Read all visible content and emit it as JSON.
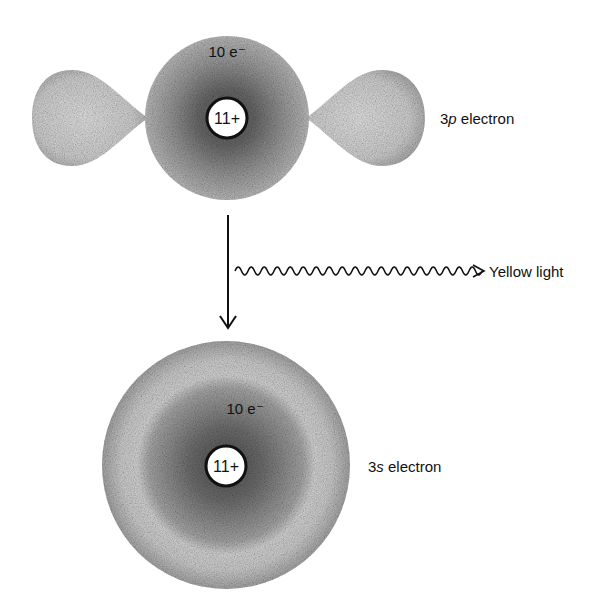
{
  "top_atom": {
    "core_label": "10 e⁻",
    "nucleus_label": "11+",
    "orbital_label_prefix": "3",
    "orbital_label_letter": "p",
    "orbital_label_suffix": " electron"
  },
  "transition": {
    "emission_label": "Yellow light"
  },
  "bottom_atom": {
    "core_label": "10 e⁻",
    "nucleus_label": "11+",
    "orbital_label_prefix": "3",
    "orbital_label_letter": "s",
    "orbital_label_suffix": " electron"
  },
  "colors": {
    "background": "#ffffff",
    "ink": "#111111",
    "cloud_dark": "#6e6e6e",
    "cloud_light": "#d8d8d8"
  }
}
